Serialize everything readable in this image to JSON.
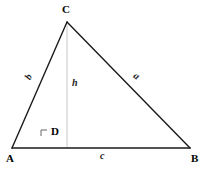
{
  "figure": {
    "type": "geometry-diagram",
    "shape": "triangle-with-altitude",
    "background_color": "#ffffff",
    "stroke_color": "#1a1a1a",
    "altitude_color": "#c8c8c8"
  },
  "vertices": {
    "C": {
      "label": "C",
      "x": 67,
      "y": 22
    },
    "A": {
      "label": "A",
      "x": 12,
      "y": 148
    },
    "B": {
      "label": "B",
      "x": 190,
      "y": 148
    },
    "D": {
      "label": "D",
      "x": 67,
      "y": 148
    }
  },
  "sides": {
    "b": {
      "label": "b",
      "from": "A",
      "to": "C"
    },
    "a": {
      "label": "a",
      "from": "C",
      "to": "B"
    },
    "c": {
      "label": "c",
      "from": "A",
      "to": "B"
    },
    "h": {
      "label": "h",
      "from": "C",
      "to": "D"
    }
  },
  "markers": {
    "right_angle_at_D": "right-angle-mark"
  }
}
